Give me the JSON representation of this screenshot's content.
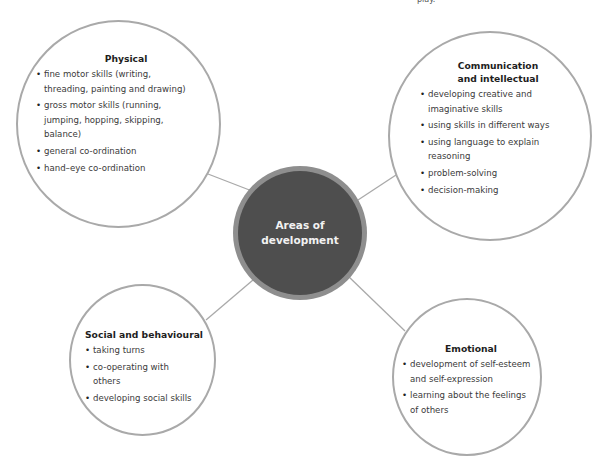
{
  "page_fragment": "play.",
  "center": {
    "label": "Areas of development",
    "fill": "#4e4e4e",
    "ring": "#8e8e8e"
  },
  "areas": [
    {
      "title": "Physical",
      "items": [
        "fine motor skills (writing, threading, painting and drawing)",
        "gross motor skills (running, jumping, hopping, skipping, balance)",
        "general co-ordination",
        "hand–eye co-ordination"
      ]
    },
    {
      "title": "Communication and intellectual",
      "items": [
        "developing creative and imaginative skills",
        "using skills in different ways",
        "using language to explain reasoning",
        "problem-solving",
        "decision-making"
      ]
    },
    {
      "title": "Social and behavioural",
      "items": [
        "taking turns",
        "co-operating with others",
        "developing social skills"
      ]
    },
    {
      "title": "Emotional",
      "items": [
        "development of self-esteem and self-expression",
        "learning about the feelings of others"
      ]
    }
  ],
  "colors": {
    "bubble_border": "#a9a9a9",
    "connector": "#a9a9a9"
  }
}
